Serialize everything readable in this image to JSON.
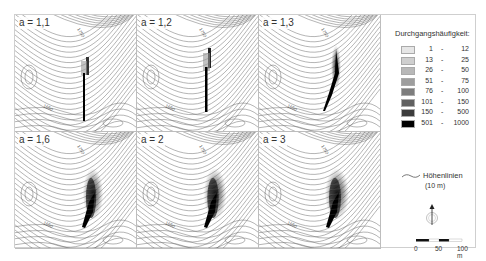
{
  "figure": {
    "maps": [
      {
        "label": "a = 1,1",
        "spread": 0.15,
        "row": 0,
        "col": 0
      },
      {
        "label": "a = 1,2",
        "spread": 0.3,
        "row": 0,
        "col": 1
      },
      {
        "label": "a = 1,3",
        "spread": 0.55,
        "row": 0,
        "col": 2
      },
      {
        "label": "a = 1,6",
        "spread": 0.85,
        "row": 1,
        "col": 0
      },
      {
        "label": "a = 2",
        "spread": 0.95,
        "row": 1,
        "col": 1
      },
      {
        "label": "a = 3",
        "spread": 1.0,
        "row": 1,
        "col": 2
      }
    ],
    "contour_labels": [
      "1750",
      "1650"
    ]
  },
  "legend": {
    "title": "Durchgangshäufigkeit:",
    "classes": [
      {
        "from": "1",
        "to": "12",
        "color": "#e6e6e6"
      },
      {
        "from": "13",
        "to": "25",
        "color": "#cfcfcf"
      },
      {
        "from": "26",
        "to": "50",
        "color": "#b8b8b8"
      },
      {
        "from": "51",
        "to": "75",
        "color": "#9e9e9e"
      },
      {
        "from": "76",
        "to": "100",
        "color": "#7d7d7d"
      },
      {
        "from": "101",
        "to": "150",
        "color": "#606060"
      },
      {
        "from": "150",
        "to": "500",
        "color": "#3c3c3c"
      },
      {
        "from": "501",
        "to": "1000",
        "color": "#000000"
      }
    ],
    "contour_label": "Höhenlinien",
    "contour_interval": "(10 m)",
    "scale": {
      "ticks": [
        "0",
        "50",
        "100 m"
      ]
    }
  }
}
